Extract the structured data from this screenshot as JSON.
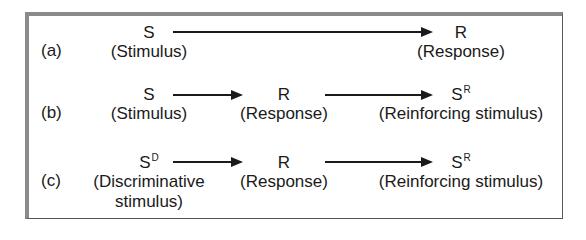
{
  "diagram": {
    "rows": [
      {
        "label": "(a)",
        "nodes": [
          {
            "symbol": "S",
            "superscript": "",
            "caption": "(Stimulus)"
          },
          {
            "symbol": "R",
            "superscript": "",
            "caption": "(Response)"
          }
        ]
      },
      {
        "label": "(b)",
        "nodes": [
          {
            "symbol": "S",
            "superscript": "",
            "caption": "(Stimulus)"
          },
          {
            "symbol": "R",
            "superscript": "",
            "caption": "(Response)"
          },
          {
            "symbol": "S",
            "superscript": "R",
            "caption": "(Reinforcing stimulus)"
          }
        ]
      },
      {
        "label": "(c)",
        "nodes": [
          {
            "symbol": "S",
            "superscript": "D",
            "caption": "(Discriminative",
            "caption2": "stimulus)"
          },
          {
            "symbol": "R",
            "superscript": "",
            "caption": "(Response)"
          },
          {
            "symbol": "S",
            "superscript": "R",
            "caption": "(Reinforcing stimulus)"
          }
        ]
      }
    ]
  }
}
